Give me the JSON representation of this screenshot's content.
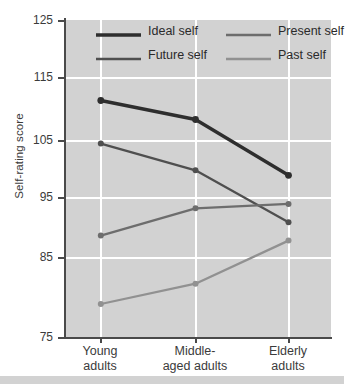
{
  "chart_data": {
    "type": "line",
    "title": "",
    "xlabel": "",
    "ylabel": "Self-rating score",
    "categories": [
      "Young adults",
      "Middle-aged adults",
      "Elderly adults"
    ],
    "ylim": [
      75,
      125
    ],
    "yticks": [
      125,
      115,
      105,
      95,
      85,
      75
    ],
    "grid": true,
    "legend_position": "top-inside",
    "series": [
      {
        "name": "Ideal self",
        "values": [
          112.3,
          109.3,
          100.5
        ],
        "color": "#2e2e2e",
        "width": 3.4
      },
      {
        "name": "Future self",
        "values": [
          105.5,
          101.3,
          93.1
        ],
        "color": "#4f4f4f",
        "width": 2.3
      },
      {
        "name": "Present self",
        "values": [
          91.0,
          95.3,
          96.0
        ],
        "color": "#6d6d6d",
        "width": 2.3
      },
      {
        "name": "Past self",
        "values": [
          80.2,
          83.4,
          90.2
        ],
        "color": "#919191",
        "width": 2.3
      }
    ]
  },
  "axes": {
    "y_title": "Self-rating score",
    "y_tick_labels": [
      "125",
      "115",
      "105",
      "95",
      "85",
      "75"
    ],
    "x_tick_labels": [
      {
        "line1": "Young",
        "line2": "adults"
      },
      {
        "line1": "Middle-",
        "line2": "aged adults"
      },
      {
        "line1": "Elderly",
        "line2": "adults"
      }
    ]
  },
  "legend": {
    "items": [
      {
        "label": "Ideal self",
        "color": "#2e2e2e",
        "width": 3.4
      },
      {
        "label": "Present self",
        "color": "#6d6d6d",
        "width": 2.3
      },
      {
        "label": "Future self",
        "color": "#4f4f4f",
        "width": 2.3
      },
      {
        "label": "Past self",
        "color": "#919191",
        "width": 2.3
      }
    ]
  },
  "colors": {
    "panel_background": "#d2d2d2",
    "gridline": "#ffffff",
    "axis": "#4a4a4a",
    "text": "#3b3b3b"
  }
}
